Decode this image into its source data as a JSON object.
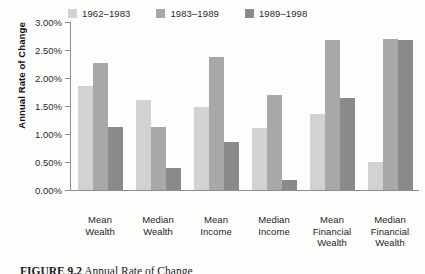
{
  "chart_data": {
    "type": "bar",
    "title": "",
    "xlabel": "",
    "ylabel": "Annual Rate of Change",
    "ylim": [
      0,
      3.0
    ],
    "ytick_labels": [
      "3.00%",
      "2.50%",
      "2.00%",
      "1.50%",
      "1.00%",
      "0.50%",
      "0.00%"
    ],
    "ytick_values": [
      3.0,
      2.5,
      2.0,
      1.5,
      1.0,
      0.5,
      0.0
    ],
    "grid": false,
    "legend_position": "top",
    "categories": [
      "Mean Wealth",
      "Median Wealth",
      "Mean Income",
      "Median Income",
      "Mean Financial Wealth",
      "Median Financial Wealth"
    ],
    "category_lines": [
      [
        "Mean",
        "Wealth"
      ],
      [
        "Median",
        "Wealth"
      ],
      [
        "Mean",
        "Income"
      ],
      [
        "Median",
        "Income"
      ],
      [
        "Mean",
        "Financial",
        "Wealth"
      ],
      [
        "Median",
        "Financial",
        "Wealth"
      ]
    ],
    "series": [
      {
        "name": "1962–1983",
        "color": "#d2d2d2",
        "values": [
          1.85,
          1.6,
          1.48,
          1.1,
          1.35,
          0.5
        ]
      },
      {
        "name": "1983–1989",
        "color": "#a8a8a8",
        "values": [
          2.27,
          1.13,
          2.37,
          1.7,
          2.68,
          2.7
        ]
      },
      {
        "name": "1989–1998",
        "color": "#8a8a8a",
        "values": [
          1.12,
          0.4,
          0.85,
          0.18,
          1.65,
          2.68
        ]
      }
    ]
  },
  "caption": {
    "label": "FIGURE 9.2",
    "text": "Annual Rate of Change"
  }
}
